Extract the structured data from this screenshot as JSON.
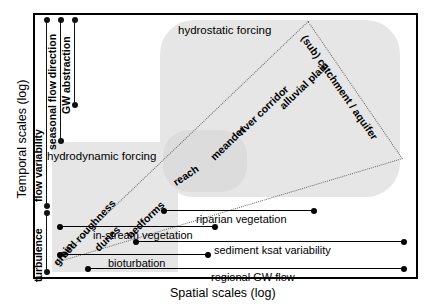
{
  "axes": {
    "y_title": "Temporal scales (log)",
    "x_title": "Spatial scales (log)"
  },
  "temporal_brackets": [
    {
      "label": "flow variability",
      "name": "flow-variability"
    },
    {
      "label": "seasonal flow direction",
      "name": "seasonal-flow-direction"
    },
    {
      "label": "GW abstraction",
      "name": "gw-abstraction"
    },
    {
      "label": "turbulence",
      "name": "turbulence"
    }
  ],
  "forcing_labels": [
    {
      "label": "hydrostatic forcing",
      "name": "hydrostatic-forcing"
    },
    {
      "label": "hydrodynamic forcing",
      "name": "hydrodynamic-forcing"
    }
  ],
  "cone_labels": [
    {
      "label": "grain",
      "name": "grain"
    },
    {
      "label": "bed roughness",
      "name": "bed-roughness"
    },
    {
      "label": "dunes",
      "name": "dunes"
    },
    {
      "label": "bedforms",
      "name": "bedforms"
    },
    {
      "label": "reach",
      "name": "reach"
    },
    {
      "label": "meander",
      "name": "meander"
    },
    {
      "label": "river corridor",
      "name": "river-corridor"
    },
    {
      "label": "alluvial plain",
      "name": "alluvial-plain"
    },
    {
      "label": "(sub) catchment / aquifer",
      "name": "sub-catchment-aquifer"
    }
  ],
  "spatial_ranges": [
    {
      "label": "riparian vegetation",
      "name": "riparian-vegetation"
    },
    {
      "label": "in-stream vegetation",
      "name": "in-stream-vegetation"
    },
    {
      "label": "sediment ksat variability",
      "name": "sediment-ksat-variability"
    },
    {
      "label": "bioturbation",
      "name": "bioturbation"
    },
    {
      "label": "regional GW flow",
      "name": "regional-GW-flow"
    }
  ],
  "colors": {
    "shade_main": "#e6e6e6",
    "shade_reach": "#dcdcdc",
    "line": "#000000",
    "cone_line": "#6b6b6b"
  }
}
